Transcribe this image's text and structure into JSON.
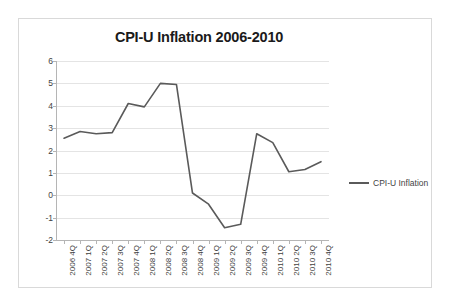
{
  "chart_data": {
    "type": "line",
    "title": "CPI-U Inflation 2006-2010",
    "xlabel": "",
    "ylabel": "",
    "ylim": [
      -2,
      6
    ],
    "ytick_step": 1,
    "yticks": [
      "6",
      "5",
      "4",
      "3",
      "2",
      "1",
      "0",
      "-1",
      "-2"
    ],
    "grid": true,
    "legend_position": "right",
    "categories": [
      "2006 4Q",
      "2007 1Q",
      "2007 2Q",
      "2007 3Q",
      "2007 4Q",
      "2008 1Q",
      "2008 2Q",
      "2008 3Q",
      "2008 4Q",
      "2009 1Q",
      "2009 2Q",
      "2009 3Q",
      "2009 4Q",
      "2010 1Q",
      "2010 2Q",
      "2010 3Q",
      "2010 4Q"
    ],
    "series": [
      {
        "name": "CPI-U Inflation",
        "color": "#5a5a5a",
        "values": [
          2.55,
          2.85,
          2.75,
          2.8,
          4.1,
          3.95,
          5.0,
          4.95,
          0.1,
          -0.4,
          -1.45,
          -1.3,
          2.75,
          2.35,
          1.05,
          1.15,
          1.5
        ]
      }
    ]
  },
  "legend": {
    "label": "CPI-U Inflation"
  }
}
